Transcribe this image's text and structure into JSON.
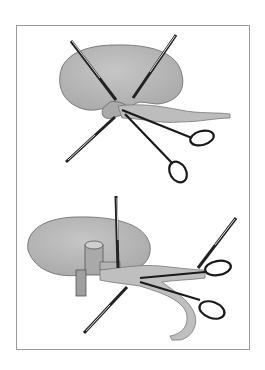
{
  "figure": {
    "panels": [
      {
        "id": "top",
        "depicts": "kidney-hilum-dissection",
        "elements": [
          "kidney",
          "renal-pelvis",
          "ureter",
          "retractor-upper-left",
          "retractor-upper-right",
          "retractor-lower-left",
          "scissors"
        ]
      },
      {
        "id": "bottom",
        "depicts": "pyeloplasty-ureter-mobilization",
        "elements": [
          "kidney",
          "renal-vessel-stump",
          "ureter",
          "needle-holder-vertical",
          "retractor-lower-left",
          "retractor-upper-right",
          "scissors-upper",
          "scissors-lower"
        ]
      }
    ],
    "colors": {
      "tissue": "#b9b9b9",
      "tissue_shade": "#9c9c9c",
      "outline": "#555555",
      "instrument": "#222222",
      "instrument_light": "#d8d8d8",
      "frame": "#9a9a9a"
    }
  }
}
